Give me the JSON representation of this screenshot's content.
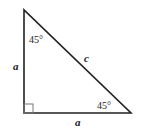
{
  "diagram": {
    "type": "right-triangle-45-45-90",
    "vertices": {
      "top": [
        24,
        10
      ],
      "right_angle": [
        24,
        113
      ],
      "bottom_right": [
        131,
        113
      ]
    },
    "right_angle_marker": {
      "x": 24,
      "y": 104,
      "size": 9
    },
    "labels": {
      "left_side": "a",
      "bottom_side": "a",
      "hypotenuse": "c",
      "top_angle": "45°",
      "bottom_right_angle": "45°"
    },
    "colors": {
      "stroke": "#222222",
      "marker_stroke": "#777777",
      "background": "#ffffff"
    }
  }
}
